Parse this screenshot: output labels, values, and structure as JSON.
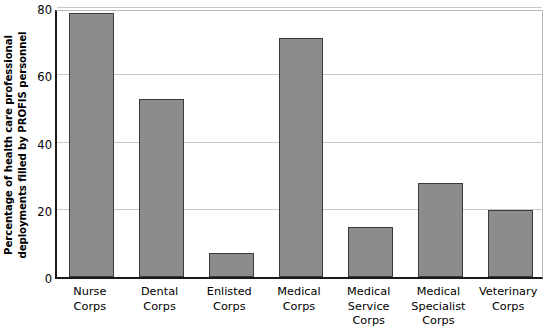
{
  "chart_data": {
    "type": "bar",
    "title": "",
    "xlabel": "",
    "ylabel": "Percentage of health care professional deployments filled by PROFIS personnel",
    "ylabel_lines": [
      "Percentage of health care professional",
      "deployments filled by PROFIS personnel"
    ],
    "categories": [
      "Nurse Corps",
      "Dental Corps",
      "Enlisted Corps",
      "Medical Corps",
      "Medical Service Corps",
      "Medical Specialist Corps",
      "Veterinary Corps"
    ],
    "category_lines": [
      [
        "Nurse",
        "Corps"
      ],
      [
        "Dental",
        "Corps"
      ],
      [
        "Enlisted",
        "Corps"
      ],
      [
        "Medical",
        "Corps"
      ],
      [
        "Medical",
        "Service",
        "Corps"
      ],
      [
        "Medical",
        "Specialist",
        "Corps"
      ],
      [
        "Veterinary",
        "Corps"
      ]
    ],
    "values": [
      78.5,
      53,
      7,
      71,
      15,
      28,
      20
    ],
    "ylim": [
      0,
      80
    ],
    "yticks": [
      0,
      20,
      40,
      60,
      80
    ],
    "ytick_labels": [
      "0",
      "20",
      "40",
      "60",
      "80"
    ],
    "grid": "horizontal",
    "legend": "none",
    "bar_color": "#8c8c8c",
    "bar_border_color": "#3a3a3a",
    "axis_color": "#1a1a1a",
    "gridline_color": "#c8c8c8",
    "background_color": "#ffffff"
  }
}
